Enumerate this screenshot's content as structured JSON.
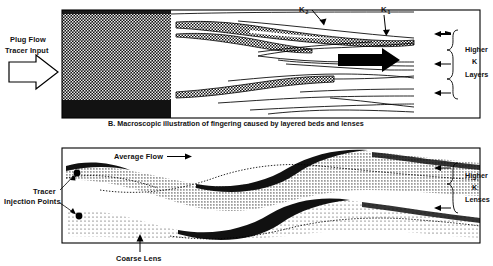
{
  "figure": {
    "caption": "B. Macroscopic illustration of fingering caused by layered beds and lenses"
  },
  "panel_top": {
    "name": "macroscopic-fingering-panel",
    "input_label_line1": "Plug Flow",
    "input_label_line2": "Tracer Input",
    "input_arrow_icon": "plug-flow-arrow-icon",
    "flow_arrow_icon": "bold-right-arrow-icon",
    "k_labels": [
      {
        "symbol": "K",
        "subscript": "2"
      },
      {
        "symbol": "K",
        "subscript": "1"
      }
    ],
    "side_label_line1": "Higher",
    "side_label_line2": "K",
    "side_label_line3": "Layers",
    "side_arrow_count": 3,
    "brace_icon": "right-brace-icon"
  },
  "panel_bottom": {
    "name": "higher-k-lenses-panel",
    "average_flow_label": "Average Flow",
    "average_flow_arrow_icon": "right-arrow-icon",
    "tracer_label_line1": "Tracer",
    "tracer_label_line2": "Injection Points",
    "tracer_point_icon": "injection-point-dot-icon",
    "tracer_point_count": 2,
    "coarse_lens_label": "Coarse Lens",
    "coarse_lens_arrow_icon": "up-arrow-icon",
    "side_label_line1": "Higher",
    "side_label_line2": "K",
    "side_label_line3": "Lenses",
    "side_arrow_count": 2,
    "brace_icon": "right-brace-icon"
  },
  "colors": {
    "ink": "#000000",
    "paper": "#ffffff",
    "dense_fill": "#1a1a1a",
    "stipple_fill": "#555555"
  }
}
